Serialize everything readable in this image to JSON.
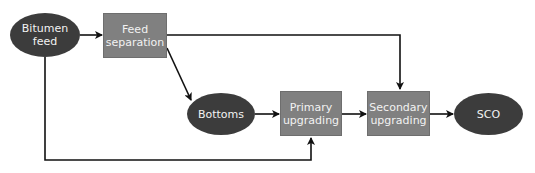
{
  "diagram": {
    "nodes": [
      {
        "id": "bitumen_feed",
        "shape": "ellipse",
        "label": "Bitumen\nfeed"
      },
      {
        "id": "feed_separation",
        "shape": "rectangle",
        "label": "Feed\nseparation"
      },
      {
        "id": "bottoms",
        "shape": "ellipse",
        "label": "Bottoms"
      },
      {
        "id": "primary_upgrading",
        "shape": "rectangle",
        "label": "Primary\nupgrading"
      },
      {
        "id": "secondary_upgrading",
        "shape": "rectangle",
        "label": "Secondary\nupgrading"
      },
      {
        "id": "sco",
        "shape": "ellipse",
        "label": "SCO"
      }
    ],
    "edges": [
      {
        "from": "bitumen_feed",
        "to": "feed_separation"
      },
      {
        "from": "feed_separation",
        "to": "bottoms"
      },
      {
        "from": "feed_separation",
        "to": "secondary_upgrading"
      },
      {
        "from": "bottoms",
        "to": "primary_upgrading"
      },
      {
        "from": "bitumen_feed",
        "to": "primary_upgrading"
      },
      {
        "from": "primary_upgrading",
        "to": "secondary_upgrading"
      },
      {
        "from": "secondary_upgrading",
        "to": "sco"
      }
    ],
    "colors": {
      "ellipse_fill": "#3c3c3c",
      "rect_fill": "#808080",
      "text": "#f2f2f2",
      "line": "#111111"
    }
  },
  "labels": {
    "bitumen_1": "Bitumen",
    "bitumen_2": "feed",
    "feedsep_1": "Feed",
    "feedsep_2": "separation",
    "bottoms": "Bottoms",
    "primary_1": "Primary",
    "primary_2": "upgrading",
    "secondary_1": "Secondary",
    "secondary_2": "upgrading",
    "sco": "SCO"
  }
}
